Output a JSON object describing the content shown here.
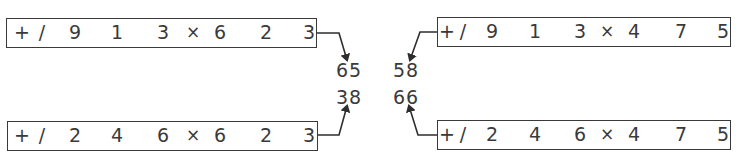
{
  "diagram": {
    "colors": {
      "ink": "#3a3a3a",
      "background": "#ffffff"
    },
    "expressions": [
      {
        "id": "top-left",
        "tokens": [
          "+",
          "/",
          "9",
          "1",
          "3",
          "×",
          "6",
          "2",
          "3"
        ],
        "result": "65"
      },
      {
        "id": "top-right",
        "tokens": [
          "+",
          "/",
          "9",
          "1",
          "3",
          "×",
          "4",
          "7",
          "5"
        ],
        "result": "58"
      },
      {
        "id": "bottom-left",
        "tokens": [
          "+",
          "/",
          "2",
          "4",
          "6",
          "×",
          "6",
          "2",
          "3"
        ],
        "result": "38"
      },
      {
        "id": "bottom-right",
        "tokens": [
          "+",
          "/",
          "2",
          "4",
          "6",
          "×",
          "4",
          "7",
          "5"
        ],
        "result": "66"
      }
    ],
    "result_matrix": [
      [
        "65",
        "58"
      ],
      [
        "38",
        "66"
      ]
    ]
  }
}
